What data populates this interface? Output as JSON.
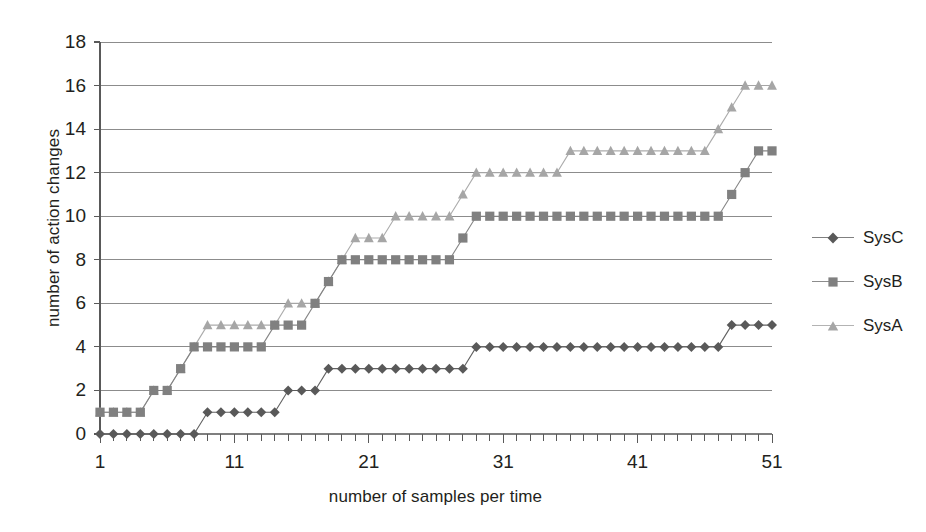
{
  "chart_data": {
    "type": "line",
    "title": "",
    "xlabel": "number of samples per time",
    "ylabel": "number of action changes",
    "xlim": [
      1,
      51
    ],
    "ylim": [
      0,
      18
    ],
    "ytick_step": 2,
    "yticks": [
      0,
      2,
      4,
      6,
      8,
      10,
      12,
      14,
      16,
      18
    ],
    "xticks": [
      1,
      11,
      21,
      31,
      41,
      51
    ],
    "xtick_labels": [
      "1",
      "11",
      "21",
      "31",
      "41",
      "51"
    ],
    "minor_xticks_every": 1,
    "grid": "horizontal",
    "legend_position": "right",
    "x": [
      1,
      2,
      3,
      4,
      5,
      6,
      7,
      8,
      9,
      10,
      11,
      12,
      13,
      14,
      15,
      16,
      17,
      18,
      19,
      20,
      21,
      22,
      23,
      24,
      25,
      26,
      27,
      28,
      29,
      30,
      31,
      32,
      33,
      34,
      35,
      36,
      37,
      38,
      39,
      40,
      41,
      42,
      43,
      44,
      45,
      46,
      47,
      48,
      49,
      50,
      51
    ],
    "series": [
      {
        "name": "SysC",
        "marker": "diamond",
        "color": "#595959",
        "values": [
          0,
          0,
          0,
          0,
          0,
          0,
          0,
          0,
          1,
          1,
          1,
          1,
          1,
          1,
          2,
          2,
          2,
          3,
          3,
          3,
          3,
          3,
          3,
          3,
          3,
          3,
          3,
          3,
          4,
          4,
          4,
          4,
          4,
          4,
          4,
          4,
          4,
          4,
          4,
          4,
          4,
          4,
          4,
          4,
          4,
          4,
          4,
          5,
          5,
          5,
          5
        ]
      },
      {
        "name": "SysB",
        "marker": "square",
        "color": "#808080",
        "values": [
          1,
          1,
          1,
          1,
          2,
          2,
          3,
          4,
          4,
          4,
          4,
          4,
          4,
          5,
          5,
          5,
          6,
          7,
          8,
          8,
          8,
          8,
          8,
          8,
          8,
          8,
          8,
          9,
          10,
          10,
          10,
          10,
          10,
          10,
          10,
          10,
          10,
          10,
          10,
          10,
          10,
          10,
          10,
          10,
          10,
          10,
          10,
          11,
          12,
          13,
          13
        ]
      },
      {
        "name": "SysA",
        "marker": "triangle",
        "color": "#a6a6a6",
        "values": [
          1,
          1,
          1,
          1,
          2,
          2,
          3,
          4,
          5,
          5,
          5,
          5,
          5,
          5,
          6,
          6,
          6,
          7,
          8,
          9,
          9,
          9,
          10,
          10,
          10,
          10,
          10,
          11,
          12,
          12,
          12,
          12,
          12,
          12,
          12,
          13,
          13,
          13,
          13,
          13,
          13,
          13,
          13,
          13,
          13,
          13,
          14,
          15,
          16,
          16,
          16
        ]
      }
    ]
  },
  "axes": {
    "x_title": "number of samples per time",
    "y_title": "number of action changes"
  },
  "legend": {
    "items": [
      {
        "label": "SysC",
        "marker": "diamond-marker",
        "color": "#595959"
      },
      {
        "label": "SysB",
        "marker": "square-marker",
        "color": "#808080"
      },
      {
        "label": "SysA",
        "marker": "triangle-marker",
        "color": "#a6a6a6"
      }
    ]
  },
  "style": {
    "grid_color": "#7f7f7f",
    "axis_color": "#595959",
    "background": "#ffffff",
    "text_color": "#231f20"
  }
}
